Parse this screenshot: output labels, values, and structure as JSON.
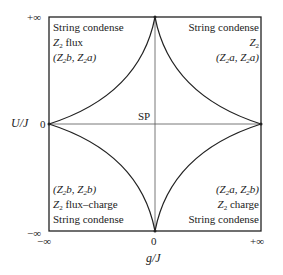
{
  "axes": {
    "y_label": "U/J",
    "x_label": "g/J",
    "y_ticks": {
      "top": "+∞",
      "middle": "0",
      "bottom": "−∞"
    },
    "x_ticks": {
      "left": "−∞",
      "middle": "0",
      "right": "+∞"
    }
  },
  "center_label": "SP",
  "regions": {
    "top_left": {
      "line1": "String condense",
      "line2_prefix": "Z",
      "line2_sub": "2",
      "line2_suffix": " flux",
      "line3": "(Z2b, Z2a)"
    },
    "top_right": {
      "line1": "String condense",
      "line2_prefix": "Z",
      "line2_sub": "2",
      "line2_suffix": "",
      "line3": "(Z2a, Z2a)"
    },
    "bottom_left": {
      "line1": "(Z2b, Z2b)",
      "line2_prefix": "Z",
      "line2_sub": "2",
      "line2_suffix": " flux–charge",
      "line3": "String condense"
    },
    "bottom_right": {
      "line1": "(Z2a, Z2b)",
      "line2_prefix": "Z",
      "line2_sub": "2",
      "line2_suffix": " charge",
      "line3": "String condense"
    }
  },
  "colors": {
    "line": "#222222",
    "axis": "#555555"
  }
}
